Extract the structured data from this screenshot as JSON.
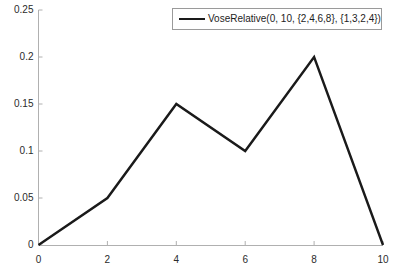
{
  "chart_data": {
    "type": "line",
    "title": "",
    "xlabel": "",
    "ylabel": "",
    "x": [
      0,
      2,
      4,
      6,
      8,
      10
    ],
    "values": [
      0,
      0.05,
      0.15,
      0.1,
      0.2,
      0
    ],
    "series": [
      {
        "name": "VoseRelative(0, 10, {2,4,6,8}, {1,3,2,4})",
        "x": [
          0,
          2,
          4,
          6,
          8,
          10
        ],
        "values": [
          0,
          0.05,
          0.15,
          0.1,
          0.2,
          0
        ],
        "color": "#1a1a1a"
      }
    ],
    "xlim": [
      0,
      10
    ],
    "ylim": [
      0,
      0.25
    ],
    "xticks": [
      0,
      2,
      4,
      6,
      8,
      10
    ],
    "yticks": [
      0,
      0.05,
      0.1,
      0.15,
      0.2,
      0.25
    ],
    "xtick_labels": [
      "0",
      "2",
      "4",
      "6",
      "8",
      "10"
    ],
    "ytick_labels": [
      "0",
      "0.05",
      "0.1",
      "0.15",
      "0.2",
      "0.25"
    ],
    "grid": false,
    "legend_position": "top-right",
    "legend": [
      "VoseRelative(0, 10, {2,4,6,8}, {1,3,2,4})"
    ],
    "annotations": []
  },
  "legend": {
    "entry_label": "VoseRelative(0, 10, {2,4,6,8}, {1,3,2,4})"
  },
  "colors": {
    "line": "#1a1a1a",
    "axis": "#b0b0b0",
    "tick": "#b0b0b0",
    "legend_border": "#9a9a9a",
    "background": "#ffffff",
    "label_text": "#2b2b2b"
  }
}
